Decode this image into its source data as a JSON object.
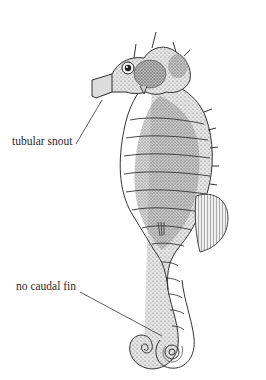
{
  "figure": {
    "labels": [
      {
        "id": "snout",
        "text": "tubular snout"
      },
      {
        "id": "tail",
        "text": "no caudal fin"
      }
    ],
    "colors": {
      "ink": "#2a2a2a",
      "shade_dark": "#555555",
      "shade_mid": "#9a9a9a",
      "shade_light": "#d8d8d8",
      "background": "#ffffff"
    }
  }
}
